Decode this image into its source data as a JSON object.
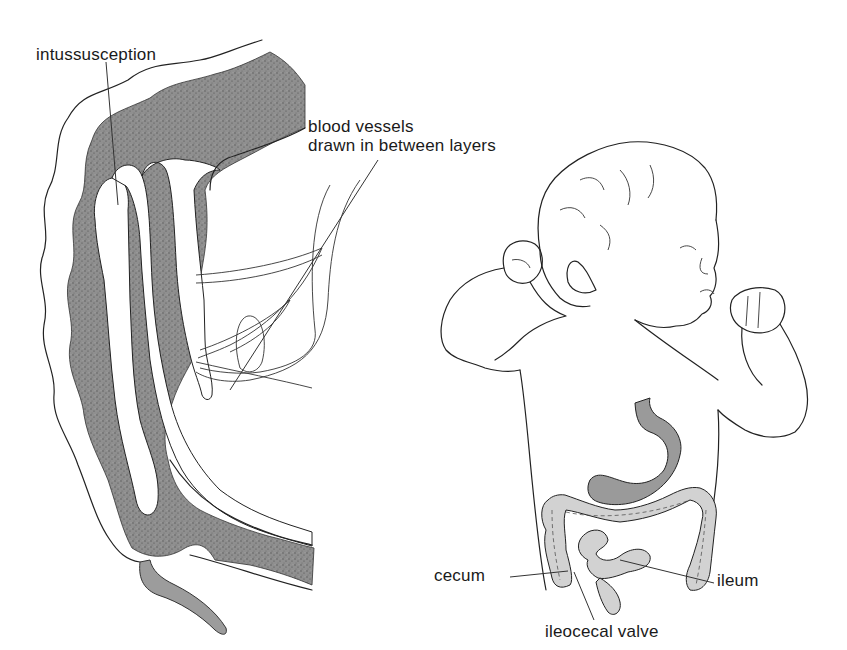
{
  "figure": {
    "left_panel": {
      "title": "intussusception diagram",
      "labels": {
        "intussusception": "intussusception",
        "blood_vessels_line1": "blood vessels",
        "blood_vessels_line2": "drawn in between layers"
      }
    },
    "right_panel": {
      "title": "child abdomen anatomy",
      "labels": {
        "cecum": "cecum",
        "ileum": "ileum",
        "ileocecal_valve": "ileocecal valve"
      }
    }
  },
  "colors": {
    "background": "#ffffff",
    "ink": "#222222",
    "stipple_dark": "#8a8a8a",
    "organ_fill": "#9a9a9a",
    "colon_fill": "#d2d2d2"
  }
}
